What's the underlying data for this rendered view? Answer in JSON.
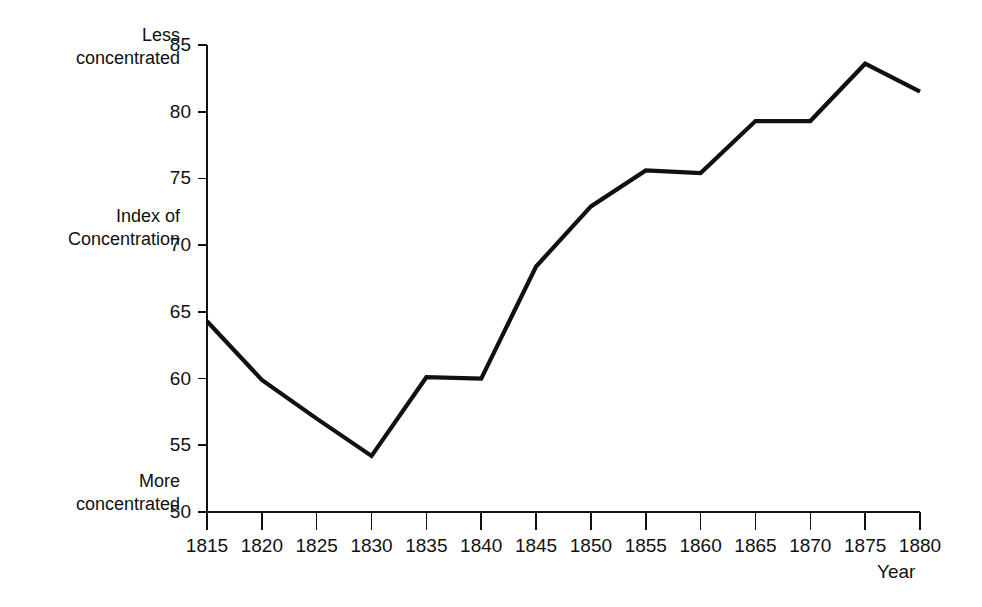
{
  "chart_data": {
    "type": "line",
    "title": "",
    "subtitle": "",
    "xlabel": "Year",
    "ylabel": "Index of Concentration",
    "ylabel_line1": "Index of",
    "ylabel_line2": "Concentration",
    "x": [
      1815,
      1820,
      1825,
      1830,
      1835,
      1840,
      1845,
      1850,
      1855,
      1860,
      1865,
      1870,
      1875,
      1880
    ],
    "values": [
      64.3,
      59.9,
      57.0,
      54.2,
      60.1,
      60.0,
      68.4,
      72.9,
      75.6,
      75.4,
      79.3,
      79.3,
      83.6,
      81.5
    ],
    "xticks": [
      "1815",
      "1820",
      "1825",
      "1830",
      "1835",
      "1840",
      "1845",
      "1850",
      "1855",
      "1860",
      "1865",
      "1870",
      "1875",
      "1880"
    ],
    "yticks": [
      "50",
      "55",
      "60",
      "65",
      "70",
      "75",
      "80",
      "85"
    ],
    "ytick_values": [
      50,
      55,
      60,
      65,
      70,
      75,
      80,
      85
    ],
    "xlim": [
      1815,
      1880
    ],
    "ylim": [
      50,
      85
    ],
    "grid": false,
    "legend": false,
    "legend_position": "none",
    "line_color": "#111111",
    "background_color": "#ffffff",
    "annotations": {
      "top_note_line1": "Less",
      "top_note_line2": "concentrated",
      "bottom_note_line1": "More",
      "bottom_note_line2": "concentrated"
    }
  }
}
